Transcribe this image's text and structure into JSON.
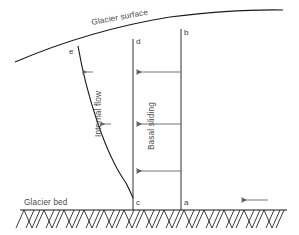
{
  "figure": {
    "type": "cross-section-diagram",
    "labels": {
      "glacier_surface": "Glacier surface",
      "glacier_bed": "Glacier bed",
      "internal_flow": "Internal flow",
      "basal_sliding": "Basal sliding"
    },
    "points": {
      "a": "a",
      "b": "b",
      "c": "c",
      "d": "d",
      "e": "e"
    },
    "colors": {
      "line": "#1a1a1a",
      "arrow": "#5d5d5d",
      "text": "#4a4a4a",
      "background": "#ffffff"
    },
    "geometry": {
      "surface_curve": "M15,62 Q90,30 170,17 Q235,9 283,10",
      "velocity_profile_curve": "M78,46 C86,92 104,150 126,182 Q131,192 133,197",
      "bed_line_y": 210,
      "bed_line_x_start": 20,
      "bed_line_x_end": 287,
      "column_d_x": 133,
      "column_b_x": 181,
      "column_top_d_y": 39,
      "column_top_b_y": 29
    },
    "arrow_rows": [
      {
        "y": 72,
        "internal_from": 92,
        "internal_to": 81,
        "basal_from": 181,
        "basal_to": 135
      },
      {
        "y": 124,
        "internal_from": 110,
        "internal_to": 99,
        "basal_from": 181,
        "basal_to": 135
      },
      {
        "y": 171,
        "internal_from": 0,
        "internal_to": 0,
        "basal_from": 181,
        "basal_to": 135
      }
    ],
    "bed_arrow": {
      "y": 200,
      "from": 268,
      "to": 240
    }
  }
}
